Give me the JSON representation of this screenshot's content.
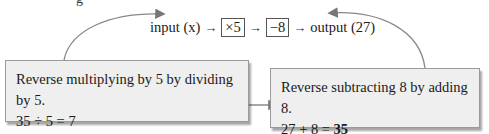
{
  "top_cut_text": "g",
  "flow": {
    "input_label": "input (x)",
    "arrow": "→",
    "step1": "×5",
    "step2": "−8",
    "output_label": "output (27)"
  },
  "left_box": {
    "line1": "Reverse multiplying by 5 by dividing by 5.",
    "line2": "35 ÷ 5 = 7",
    "line3_prefix": "x = ",
    "line3_value": "7"
  },
  "right_box": {
    "line1": "Reverse subtracting 8 by adding 8.",
    "line2_prefix": "27 + 8 = ",
    "line2_value": "35"
  },
  "colors": {
    "box_bg": "#efefef",
    "arrow": "#777777"
  }
}
